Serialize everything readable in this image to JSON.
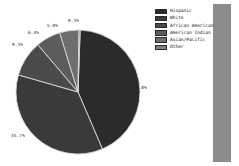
{
  "chart_data": {
    "type": "pie",
    "title": "",
    "subtitle": "",
    "xlabel": "",
    "ylabel": "",
    "legend_position": "right",
    "grid": false,
    "categories": [
      "Hispanic",
      "White",
      "African American",
      "American Indian",
      "Asian/Pacific",
      "Other"
    ],
    "values": [
      42.8,
      35.7,
      9.3,
      6.4,
      5.0,
      0.3
    ],
    "labels": [
      "42.8%",
      "35.7%",
      "9.3%",
      "6.4%",
      "5.0%",
      "0.3%"
    ],
    "colors": [
      "#2b2b2b",
      "#3a3a3a",
      "#4a4a4a",
      "#5c5c5c",
      "#6e6e6e",
      "#828282"
    ],
    "startangle_deg": -88,
    "direction": "clockwise"
  },
  "legend": {
    "items": [
      {
        "label": "Hispanic",
        "color": "#2b2b2b"
      },
      {
        "label": "White",
        "color": "#3a3a3a"
      },
      {
        "label": "African American",
        "color": "#4a4a4a"
      },
      {
        "label": "American Indian",
        "color": "#5c5c5c"
      },
      {
        "label": "Asian/Pacific",
        "color": "#6e6e6e"
      },
      {
        "label": "Other",
        "color": "#828282"
      }
    ]
  },
  "slice_labels": {
    "hispanic": "42.8%",
    "white": "35.7%",
    "african_american": "9.3%",
    "american_indian": "6.4%",
    "asian_pacific": "5.0%",
    "other": "0.3%"
  },
  "decor": {
    "right_band_color": "#8c8c8c"
  }
}
